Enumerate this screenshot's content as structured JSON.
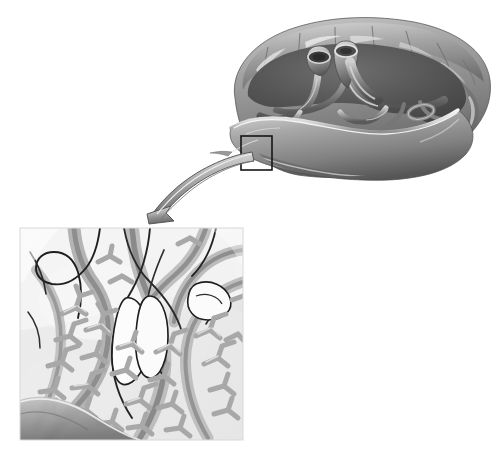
{
  "figure": {
    "title": "Placenta with magnified detail of chorionic villi",
    "caption": "",
    "background_color": "#ffffff",
    "rendering": "grayscale anatomical illustration",
    "width": 502,
    "height": 462
  },
  "organ": {
    "name": "placenta",
    "view": "fetal surface cut away showing cotyledons and chorionic vessels",
    "label": "",
    "bounds": {
      "x": 228,
      "y": 18,
      "width": 262,
      "height": 160
    },
    "colors": {
      "body_light": "#b9b9b9",
      "body_mid": "#8e8e8e",
      "body_dark": "#5e5e5e",
      "body_shadow": "#3f3f3f",
      "highlight": "#e6e6e6",
      "rim_light": "#f2f2f2"
    },
    "parts": [
      {
        "name": "umbilical-vein-stump",
        "label": ""
      },
      {
        "name": "umbilical-artery-stump",
        "label": ""
      },
      {
        "name": "chorionic-vessel-branches",
        "label": ""
      },
      {
        "name": "cotyledon-lobes",
        "label": ""
      },
      {
        "name": "maternal-surface-rim",
        "label": ""
      }
    ]
  },
  "detail_box": {
    "name": "detail-region-box",
    "label": "",
    "stroke_color": "#161616",
    "stroke_width": 1.6,
    "x": 241,
    "y": 136,
    "width": 31,
    "height": 34
  },
  "arrow": {
    "name": "magnify-arrow",
    "label": "",
    "direction": "from detail box down-left to inset panel",
    "fill_light": "#d2d2d2",
    "fill_mid": "#9a9a9a",
    "fill_dark": "#6f6f6f",
    "stroke_color": "#4a4a4a",
    "tip": {
      "x": 147,
      "y": 214
    },
    "tail": {
      "x": 252,
      "y": 160
    }
  },
  "inset_panel": {
    "name": "villi-detail-panel",
    "label": "",
    "x": 20,
    "y": 228,
    "width": 223,
    "height": 212,
    "background": "#efefef",
    "border_color": "#d8d8d8",
    "contents": [
      {
        "name": "stem-villus-trunk",
        "label": ""
      },
      {
        "name": "chorionic-villi-branches",
        "label": ""
      },
      {
        "name": "fetal-capillary-vessels",
        "label": ""
      },
      {
        "name": "intervillous-space",
        "label": ""
      },
      {
        "name": "decidua-basalis-band",
        "label": ""
      }
    ],
    "colors": {
      "space_light": "#f4f4f4",
      "space_mid": "#e2e2e2",
      "villi_fill": "#cfcfcf",
      "villi_edge": "#9c9c9c",
      "vessel_gray": "#8a8a8a",
      "vessel_dark": "#636363",
      "outline_black": "#1b1b1b",
      "basal_shadow": "#9a9a9a"
    }
  }
}
